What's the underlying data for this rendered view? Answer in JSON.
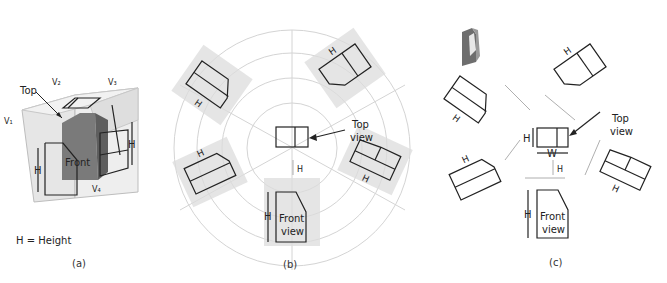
{
  "figure": {
    "panel_a": {
      "caption": "(a)",
      "legend": "H = Height",
      "labels": {
        "top": "Top",
        "front": "Front",
        "height": "H",
        "v1": "V₁",
        "v2": "V₂",
        "v3": "V₃",
        "v4": "V₄"
      }
    },
    "panel_b": {
      "caption": "(b)",
      "top_view_label_line1": "Top",
      "top_view_label_line2": "view",
      "front_view_label_line1": "Front",
      "front_view_label_line2": "view",
      "height": "H"
    },
    "panel_c": {
      "caption": "(c)",
      "top_view_label_line1": "Top",
      "top_view_label_line2": "view",
      "front_view_label_line1": "Front",
      "front_view_label_line2": "view",
      "height": "H",
      "width": "W"
    },
    "colors": {
      "line": "#222222",
      "shade": "#dcdcdc",
      "object": "#7a7a7a",
      "faint": "#d4d4d4"
    }
  }
}
